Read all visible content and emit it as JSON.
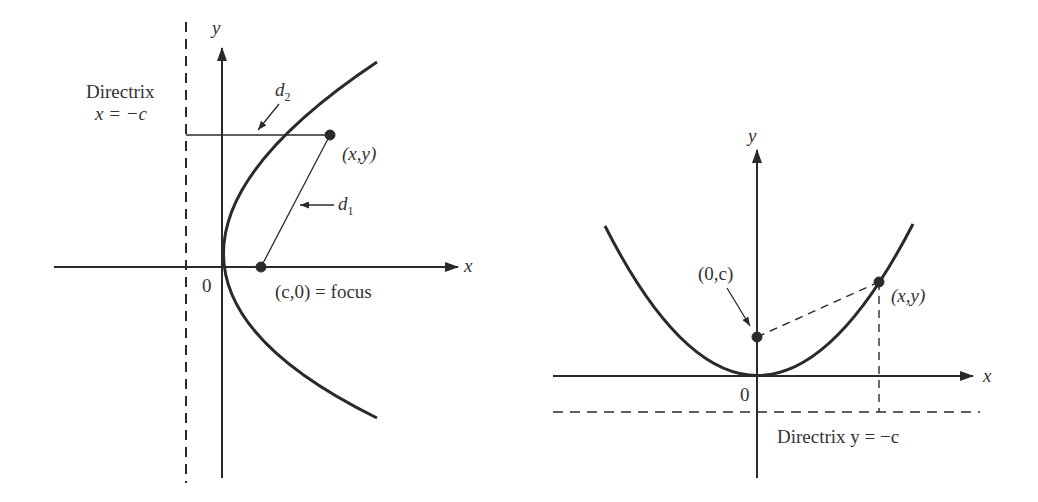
{
  "left_figure": {
    "y_axis_label": "y",
    "x_axis_label": "x",
    "origin_label": "0",
    "directrix_label": "Directrix",
    "directrix_eq": "x = −c",
    "d2_label": "d",
    "d2_sub": "2",
    "d1_label": "d",
    "d1_sub": "1",
    "point_label": "(x,y)",
    "focus_label": "(c,0) = focus"
  },
  "right_figure": {
    "y_axis_label": "y",
    "x_axis_label": "x",
    "origin_label": "0",
    "focus_label": "(0,c)",
    "point_label": "(x,y)",
    "directrix_label": "Directrix y = −c"
  },
  "colors": {
    "ink": "#2a2a2a",
    "background": "#ffffff"
  }
}
